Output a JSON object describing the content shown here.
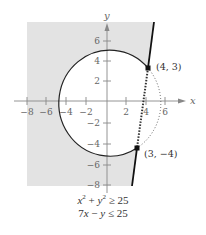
{
  "axes": {
    "x_label": "x",
    "y_label": "y",
    "x_ticks": [
      {
        "value": -8,
        "label": "−8"
      },
      {
        "value": -6,
        "label": "−6"
      },
      {
        "value": -4,
        "label": "−4"
      },
      {
        "value": -2,
        "label": "−2"
      },
      {
        "value": 2,
        "label": "2"
      },
      {
        "value": 4,
        "label": "4"
      },
      {
        "value": 6,
        "label": "6"
      }
    ],
    "y_ticks": [
      {
        "value": 6,
        "label": "6"
      },
      {
        "value": 4,
        "label": "4"
      },
      {
        "value": 2,
        "label": "2"
      },
      {
        "value": -2,
        "label": "−2"
      },
      {
        "value": -4,
        "label": "−4"
      },
      {
        "value": -6,
        "label": "−6"
      },
      {
        "value": -8,
        "label": "−8"
      }
    ]
  },
  "points": [
    {
      "label": "(4, 3)",
      "x": 4,
      "y": 3
    },
    {
      "label": "(3, −4)",
      "x": 3,
      "y": -4
    }
  ],
  "inequalities": [
    {
      "lhs_a": "x",
      "sup_a": "2",
      "mid": " + ",
      "lhs_b": "y",
      "sup_b": "2",
      "op": " ≥ 25"
    },
    {
      "text_a": "7",
      "var_a": "x",
      "mid": " − ",
      "var_b": "y",
      "op": " ≤ 25"
    }
  ],
  "colors": {
    "shade": "#e3e3e3",
    "axis": "#888888",
    "curve": "#222222"
  }
}
